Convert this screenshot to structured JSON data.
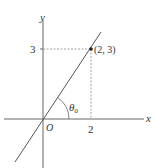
{
  "diagram": {
    "type": "coordinate-plane-line",
    "axes": {
      "x_label": "x",
      "y_label": "y",
      "origin_label": "O"
    },
    "point": {
      "label": "(2, 3)",
      "x": 2,
      "y": 3
    },
    "ticks": {
      "x_tick_label": "2",
      "y_tick_label": "3"
    },
    "angle": {
      "symbol": "θ",
      "subscript": "0"
    },
    "colors": {
      "axis": "#555555",
      "line": "#555555",
      "guide": "#999999",
      "text": "#333333"
    }
  }
}
